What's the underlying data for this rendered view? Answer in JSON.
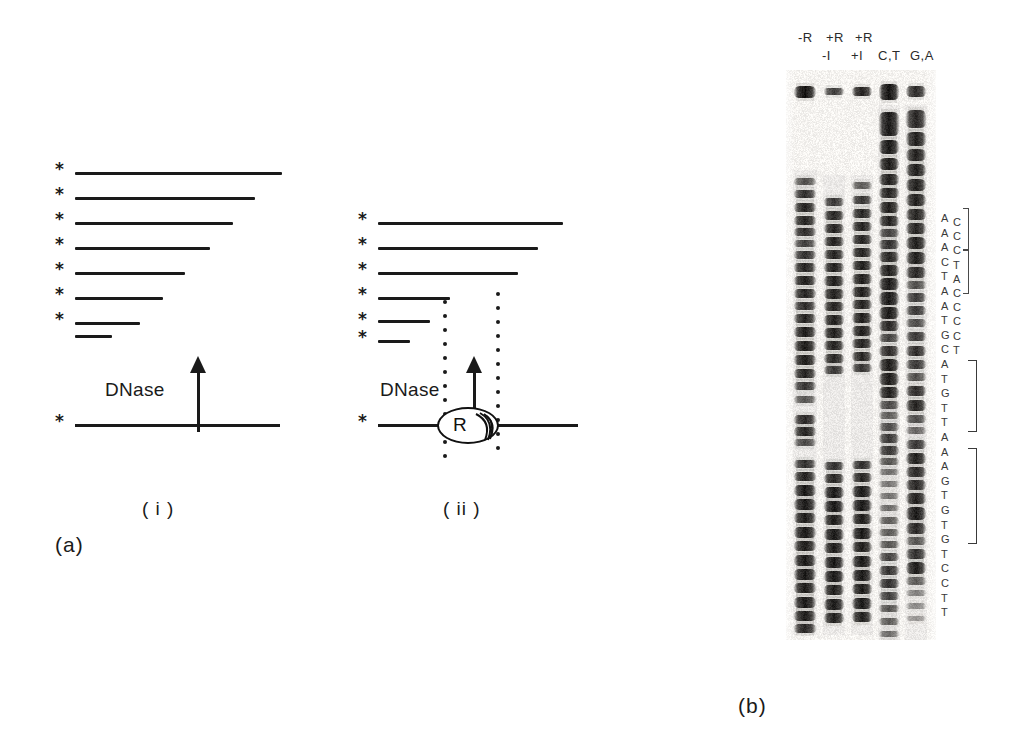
{
  "figure": {
    "panel_a_label": "(a)",
    "panel_b_label": "(b)",
    "subpanel_i_label": "( i )",
    "subpanel_ii_label": "( ii )",
    "dnase_label_i": "DNase",
    "dnase_label_ii": "DNase",
    "protein_label": "R",
    "star_glyph": "*",
    "ink_color": "#1a1a1a",
    "background_color": "#ffffff"
  },
  "panel_a": {
    "subpanel_i": {
      "caption": "( i )",
      "star_count": 9,
      "fragment_lengths_px": [
        207,
        180,
        158,
        135,
        110,
        88,
        65,
        37
      ],
      "full_strand_length_px": 205,
      "dnase_text": "DNase"
    },
    "subpanel_ii": {
      "caption": "( ii )",
      "star_count": 7,
      "fragment_lengths_px": [
        185,
        160,
        140,
        72,
        52,
        32
      ],
      "full_strand_length_px": 200,
      "dnase_text": "DNase",
      "bound_protein": "R",
      "footprint_boundary_dots_per_column": 12
    }
  },
  "panel_b": {
    "caption": "(b)",
    "lane_headers_row1": [
      "-R",
      "+R",
      "+R"
    ],
    "lane_headers_row2": [
      "-I",
      "+I",
      "C,T",
      "G,A"
    ],
    "lanes": [
      {
        "name": "lane-minus-R",
        "label": "-R"
      },
      {
        "name": "lane-plus-R-minus-I",
        "label": "+R -I"
      },
      {
        "name": "lane-plus-R-plus-I",
        "label": "+R +I"
      },
      {
        "name": "lane-CT-ladder",
        "label": "C,T"
      },
      {
        "name": "lane-GA-ladder",
        "label": "G,A"
      }
    ],
    "sequence_column_main": [
      "A",
      "A",
      "A",
      "C",
      "T",
      "A",
      "A",
      "T",
      "G",
      "C",
      "A",
      "T",
      "G",
      "T",
      "T",
      "A",
      "A",
      "A",
      "G",
      "T",
      "G",
      "T",
      "G",
      "T",
      "C",
      "C",
      "T",
      "T"
    ],
    "sequence_column_inset": [
      "C",
      "C",
      "C",
      "T",
      "A",
      "C",
      "C",
      "C",
      "C",
      "T"
    ],
    "bracket_regions": [
      {
        "name": "footprint-bracket-1",
        "top_px": 208,
        "height_px": 42
      },
      {
        "name": "footprint-bracket-2",
        "top_px": 250,
        "height_px": 44
      },
      {
        "name": "footprint-bracket-3",
        "top_px": 360,
        "height_px": 72
      },
      {
        "name": "footprint-bracket-4",
        "top_px": 448,
        "height_px": 96
      }
    ]
  }
}
